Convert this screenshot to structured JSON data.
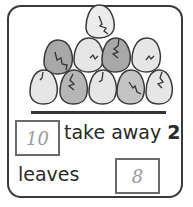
{
  "eggs": {
    "total": 10,
    "shaded": 4,
    "arrangement": "pyramid rows of 1, 4, 5",
    "colors": {
      "light": "#e8e8e8",
      "dark": "#a8a8a8",
      "outline": "#3a3a3a"
    }
  },
  "problem": {
    "start_answer": "10",
    "take_away_label": "take away",
    "take_away_value": "2",
    "leaves_label": "leaves",
    "result_answer": "8"
  }
}
